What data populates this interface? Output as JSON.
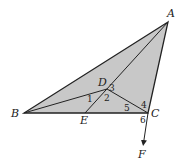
{
  "diagram": {
    "type": "geometry",
    "fill_color": "#c8c8c8",
    "stroke_color": "#222222",
    "background": "#ffffff",
    "points": {
      "A": {
        "label": "A",
        "x": 168,
        "y": 22
      },
      "B": {
        "label": "B",
        "x": 24,
        "y": 113
      },
      "C": {
        "label": "C",
        "x": 148,
        "y": 113
      },
      "D": {
        "label": "D",
        "x": 107,
        "y": 89
      },
      "E": {
        "label": "E",
        "x": 85,
        "y": 113
      },
      "F": {
        "label": "F",
        "x": 143,
        "y": 145
      }
    },
    "segments": [
      "AB",
      "BC",
      "CA",
      "AE",
      "BD",
      "DC",
      "CF"
    ],
    "filled_polygon": [
      "A",
      "B",
      "C"
    ],
    "arrow": {
      "from": "C",
      "to": "F"
    },
    "angle_labels": [
      "1",
      "2",
      "3",
      "4",
      "5",
      "6"
    ]
  }
}
